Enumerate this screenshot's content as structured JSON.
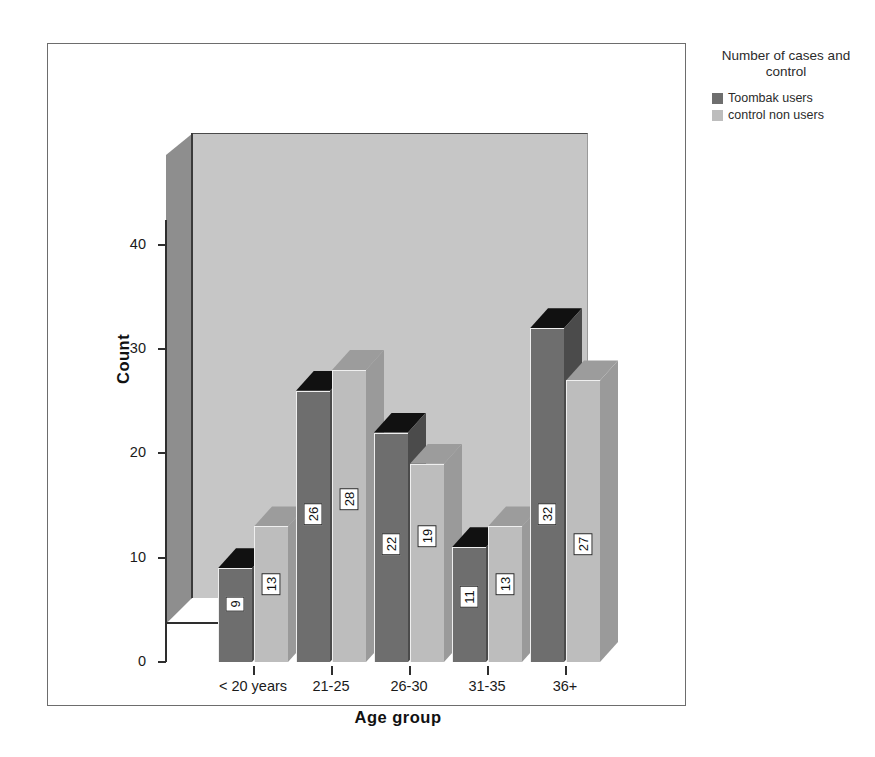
{
  "legend": {
    "title": "Number of cases and\ncontrol",
    "items": [
      {
        "label": "Toombak users",
        "color": "#6e6e6e"
      },
      {
        "label": "control non users",
        "color": "#bdbdbd"
      }
    ]
  },
  "axes": {
    "y_title": "Count",
    "x_title": "Age group",
    "y_ticks": [
      "0",
      "10",
      "20",
      "30",
      "40"
    ]
  },
  "chart_data": {
    "type": "bar",
    "title": "",
    "subtitle": "",
    "xlabel": "Age group",
    "ylabel": "Count",
    "categories": [
      "< 20 years",
      "21-25",
      "26-30",
      "31-35",
      "36+"
    ],
    "series": [
      {
        "name": "Toombak users",
        "color": "#6e6e6e",
        "values": [
          9,
          26,
          22,
          11,
          32
        ]
      },
      {
        "name": "control non users",
        "color": "#bdbdbd",
        "values": [
          13,
          28,
          19,
          13,
          27
        ]
      }
    ],
    "ylim": [
      0,
      45
    ],
    "ytick_step": 10,
    "grid": false,
    "legend_position": "right",
    "legend_title": "Number of cases and control",
    "data_labels": true,
    "three_d": true
  }
}
